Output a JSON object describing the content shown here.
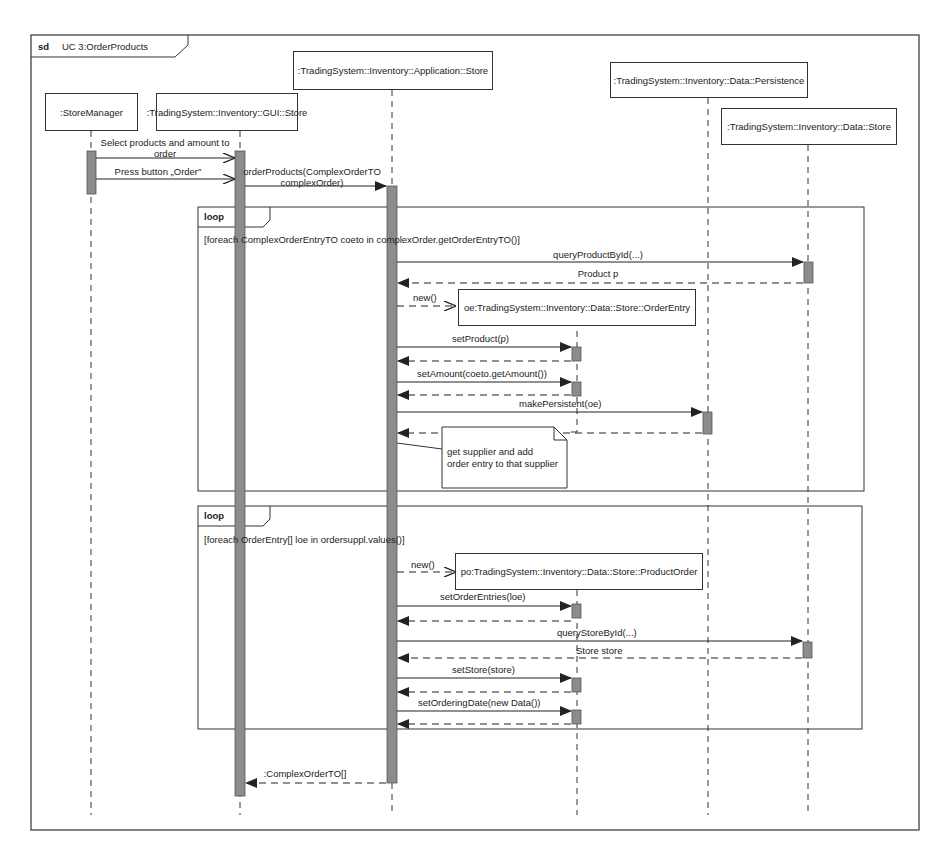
{
  "frame": {
    "keyword": "sd",
    "title": "UC 3:OrderProducts"
  },
  "lifelines": [
    {
      "id": "storemanager",
      "label": ":StoreManager"
    },
    {
      "id": "gui_store",
      "label": ":TradingSystem::Inventory::GUI::Store"
    },
    {
      "id": "app_store",
      "label": ":TradingSystem::Inventory::Application::Store"
    },
    {
      "id": "persistence",
      "label": ":TradingSystem::Inventory::Data::Persistence"
    },
    {
      "id": "data_store",
      "label": ":TradingSystem::Inventory::Data::Store"
    },
    {
      "id": "order_entry",
      "label": "oe:TradingSystem::Inventory::Data::Store::OrderEntry"
    },
    {
      "id": "product_order",
      "label": "po:TradingSystem::Inventory::Data::Store::ProductOrder"
    }
  ],
  "messages": {
    "select_products_1": "Select products and amount to",
    "select_products_2": "order",
    "press_order": "Press button „Order\"",
    "order_products_1": "orderProducts(ComplexOrderTO",
    "order_products_2": "complexOrder)",
    "query_product": "queryProductById(...)",
    "product_p": "Product p",
    "new_oe": "new()",
    "set_product": "setProduct(p)",
    "set_amount": "setAmount(coeto.getAmount())",
    "make_persistent": "makePersistent(oe)",
    "new_po": "new()",
    "set_order_entries": "setOrderEntries(loe)",
    "query_store": "queryStoreById(...)",
    "store_store": "Store store",
    "set_store": "setStore(store)",
    "set_ordering_date": "setOrderingDate(new Data())",
    "return_complex": ":ComplexOrderTO[]"
  },
  "fragments": [
    {
      "operator": "loop",
      "guard": "[foreach ComplexOrderEntryTO coeto in complexOrder.getOrderEntryTO()]"
    },
    {
      "operator": "loop",
      "guard": "[foreach OrderEntry[] loe in ordersuppl.values()]"
    }
  ],
  "note": {
    "line1": "get supplier and add",
    "line2": "order entry to that supplier"
  },
  "colors": {
    "activation": "#8c8c8c",
    "line": "#333333"
  }
}
